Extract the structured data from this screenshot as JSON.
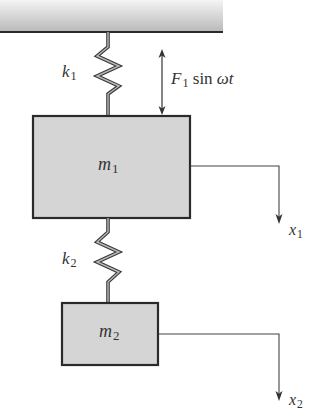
{
  "diagram": {
    "ceiling": {
      "x": 0,
      "y": 0,
      "width": 223,
      "height": 32,
      "gradient_top": "#f4f4f4",
      "gradient_bottom": "#b9b9b9",
      "edge_color": "#2a2a2a"
    },
    "springs": [
      {
        "id": "k1",
        "label": "k",
        "subscript": "1",
        "x": 108,
        "y_top": 32,
        "y_bottom": 115
      },
      {
        "id": "k2",
        "label": "k",
        "subscript": "2",
        "x": 108,
        "y_top": 218,
        "y_bottom": 303
      }
    ],
    "masses": [
      {
        "id": "m1",
        "label": "m",
        "subscript": "1",
        "x": 32,
        "y": 115,
        "width": 158,
        "height": 103,
        "fill": "#d5d5d5",
        "stroke": "#2a2a2a"
      },
      {
        "id": "m2",
        "label": "m",
        "subscript": "2",
        "x": 62,
        "y": 303,
        "width": 96,
        "height": 62,
        "fill": "#d5d5d5",
        "stroke": "#2a2a2a"
      }
    ],
    "force": {
      "symbol": "F",
      "subscript": "1",
      "function_text": "sin",
      "argument": "ωt",
      "arrow_x": 162,
      "arrow_y_top": 50,
      "arrow_y_bottom": 115,
      "double_headed": true
    },
    "displacements": [
      {
        "id": "x1",
        "label": "x",
        "subscript": "1",
        "from_x": 190,
        "y": 166,
        "arrow_x": 279,
        "arrow_y_end": 222
      },
      {
        "id": "x2",
        "label": "x",
        "subscript": "2",
        "from_x": 158,
        "y": 334,
        "arrow_x": 279,
        "arrow_y_end": 400
      }
    ],
    "line_color": "#444444"
  }
}
